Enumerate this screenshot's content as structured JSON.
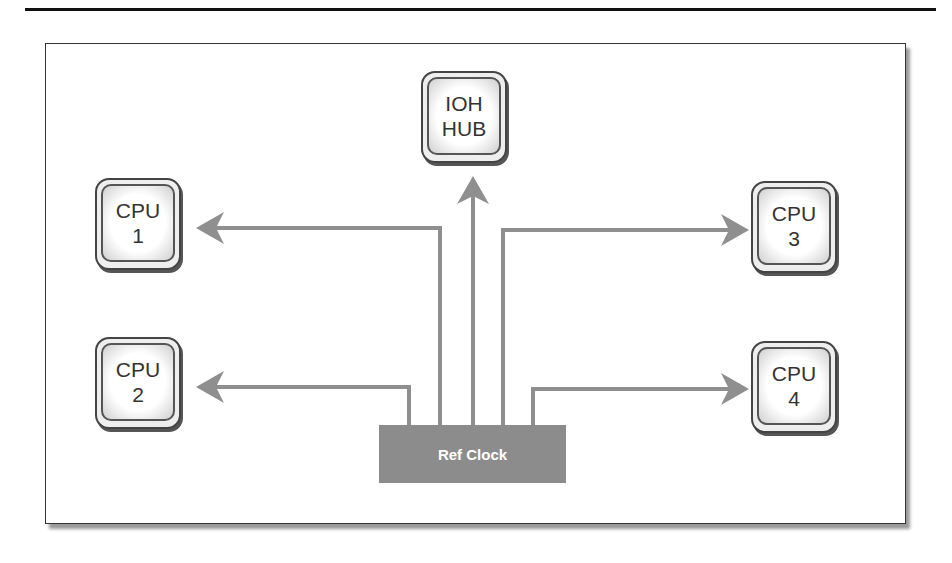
{
  "diagram": {
    "nodes": [
      {
        "id": "ioh",
        "line1": "IOH",
        "line2": "HUB"
      },
      {
        "id": "cpu1",
        "line1": "CPU",
        "line2": "1"
      },
      {
        "id": "cpu2",
        "line1": "CPU",
        "line2": "2"
      },
      {
        "id": "cpu3",
        "line1": "CPU",
        "line2": "3"
      },
      {
        "id": "cpu4",
        "line1": "CPU",
        "line2": "4"
      }
    ],
    "source": {
      "label": "Ref Clock"
    },
    "edges": [
      {
        "from": "Ref Clock",
        "to": "CPU 1"
      },
      {
        "from": "Ref Clock",
        "to": "CPU 2"
      },
      {
        "from": "Ref Clock",
        "to": "IOH HUB"
      },
      {
        "from": "Ref Clock",
        "to": "CPU 3"
      },
      {
        "from": "Ref Clock",
        "to": "CPU 4"
      }
    ],
    "colors": {
      "wire": "#8f8f8f",
      "ref_clock": "#8c8c8c",
      "border": "#444444"
    }
  }
}
